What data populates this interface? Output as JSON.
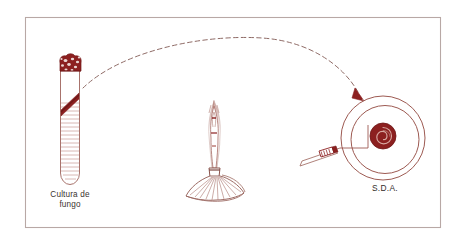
{
  "figure": {
    "caption_hidden": "",
    "border_color": "#b5a5a2",
    "background_color": "#ffffff",
    "ink_dark_red": "#8c2020",
    "ink_mid_red": "#a33a33",
    "ink_light_red": "#b97f78",
    "ink_outline": "#9d6b64",
    "text_color": "#3a3330"
  },
  "labels": {
    "tube_label_line1": "Cultura de",
    "tube_label_line2": "fungo",
    "plate_label": "S.D.A."
  },
  "objects": {
    "test_tube": {
      "name": "fungal culture slant tube",
      "plug": "cotton plug",
      "slant": "agar slant with fungal growth",
      "hatching_lines": 24
    },
    "burner": {
      "name": "alcohol burner flame",
      "flame": "flame",
      "base": "flared burner base"
    },
    "needle": {
      "name": "inoculation needle",
      "handle": "hatched grip handle",
      "wire": "transfer wire"
    },
    "plate": {
      "name": "petri dish",
      "medium": "S.D.A.",
      "colony": "spiral fungal colony",
      "rings": 2
    },
    "transfer_arrow": {
      "name": "dashed transfer arc",
      "style": "dashed",
      "direction": "left to right, arrowhead at plate"
    }
  },
  "geometry": {
    "frame": {
      "x": 25,
      "y": 17,
      "w": 416,
      "h": 211
    },
    "tube": {
      "cx": 70,
      "top": 57,
      "bottom": 184,
      "width": 20
    },
    "burner": {
      "cx": 214,
      "flame_top": 100,
      "base_y": 196
    },
    "plate": {
      "cx": 383,
      "cy": 138,
      "r_outer": 42,
      "r_inner": 34
    },
    "colony": {
      "cx": 383,
      "cy": 136,
      "r": 13
    },
    "arc": {
      "x1": 82,
      "y1": 86,
      "cx": 235,
      "cy": 18,
      "x2": 360,
      "y2": 98
    }
  }
}
